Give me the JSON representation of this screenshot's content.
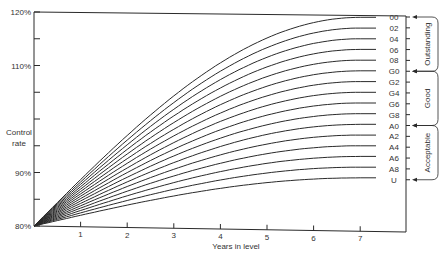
{
  "chart_data": {
    "type": "line",
    "title": "",
    "xlabel": "Years in level",
    "ylabel": "Control rate",
    "x_ticks": [
      "1",
      "2",
      "3",
      "4",
      "5",
      "6",
      "7"
    ],
    "y_ticks": [
      {
        "value": 80,
        "label": "80%"
      },
      {
        "value": 90,
        "label": "90%"
      },
      {
        "value": 110,
        "label": "110%"
      },
      {
        "value": 120,
        "label": "120%"
      }
    ],
    "y_minor_ticks": [
      85,
      95,
      100,
      105,
      115
    ],
    "xlim": [
      0,
      8
    ],
    "ylim": [
      80,
      120
    ],
    "grid": false,
    "start_value": 80,
    "plateau_year": 7,
    "series": [
      {
        "name": "00",
        "final": 119
      },
      {
        "name": "02",
        "final": 117
      },
      {
        "name": "04",
        "final": 115
      },
      {
        "name": "06",
        "final": 113
      },
      {
        "name": "08",
        "final": 111
      },
      {
        "name": "G0",
        "final": 109
      },
      {
        "name": "G2",
        "final": 107
      },
      {
        "name": "G4",
        "final": 105
      },
      {
        "name": "G6",
        "final": 103
      },
      {
        "name": "G8",
        "final": 101
      },
      {
        "name": "A0",
        "final": 99
      },
      {
        "name": "A2",
        "final": 97
      },
      {
        "name": "A4",
        "final": 95
      },
      {
        "name": "A6",
        "final": 93
      },
      {
        "name": "A8",
        "final": 91
      },
      {
        "name": "U",
        "final": 89
      }
    ],
    "bands": [
      {
        "label": "Outstanding",
        "from": "00",
        "to": "G0"
      },
      {
        "label": "Good",
        "from": "G0",
        "to": "A0"
      },
      {
        "label": "Acceptable",
        "from": "A0",
        "to": "U"
      }
    ],
    "legend_position": "right"
  },
  "colors": {
    "line": "#2a2a2a",
    "text": "#333333",
    "background": "#ffffff"
  }
}
